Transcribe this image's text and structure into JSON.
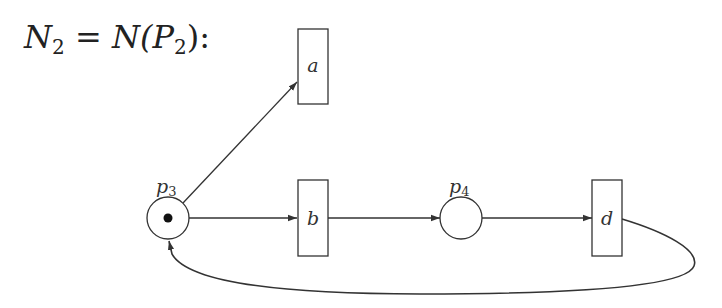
{
  "title": {
    "lhs": "N",
    "lhs_sub": "2",
    "eq": " = ",
    "rhs_func": "N(",
    "rhs_arg": "P",
    "rhs_sub": "2",
    "rhs_close": "):"
  },
  "places": [
    {
      "id": "p3",
      "label": "p",
      "sub": "3",
      "tokens": 1
    },
    {
      "id": "p4",
      "label": "p",
      "sub": "4",
      "tokens": 0
    }
  ],
  "transitions": [
    {
      "id": "a",
      "label": "a"
    },
    {
      "id": "b",
      "label": "b"
    },
    {
      "id": "d",
      "label": "d"
    }
  ],
  "arcs": [
    {
      "from": "p3",
      "to": "a"
    },
    {
      "from": "p3",
      "to": "b"
    },
    {
      "from": "b",
      "to": "p4"
    },
    {
      "from": "p4",
      "to": "d"
    },
    {
      "from": "d",
      "to": "p3"
    }
  ],
  "colors": {
    "stroke": "#333333",
    "background": "#ffffff"
  }
}
